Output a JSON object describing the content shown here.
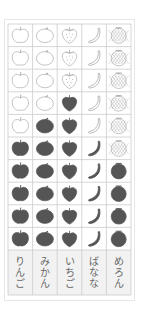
{
  "chart_data": {
    "type": "pictograph",
    "title": "",
    "max_rows": 10,
    "categories": [
      "りんご",
      "みかん",
      "いちご",
      "ばなな",
      "めろん"
    ],
    "icons": [
      "apple-icon",
      "mikan-icon",
      "strawberry-icon",
      "banana-icon",
      "melon-icon"
    ],
    "values": [
      5,
      6,
      7,
      5,
      4
    ],
    "colors": {
      "filled": "#555555",
      "outline": "#aaaaaa",
      "grid": "#cccccc",
      "label_bg": "#f2f2f2"
    }
  }
}
